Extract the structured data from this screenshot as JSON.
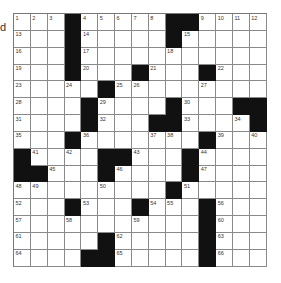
{
  "puzzle": {
    "edge_text": "d",
    "rows": 15,
    "cols": 15,
    "colors": {
      "block": "#111111",
      "cell": "#ffffff",
      "line": "#8a8a8a"
    },
    "grid": [
      [
        "1",
        "2",
        "3",
        "#",
        "4",
        "5",
        "6",
        "7",
        "8",
        "#",
        "#",
        "9",
        "10",
        "11",
        "12"
      ],
      [
        "13",
        "",
        "",
        "#",
        "14",
        "",
        "",
        "",
        "",
        "#",
        "15",
        "",
        "",
        "",
        ""
      ],
      [
        "16",
        "",
        "",
        "#",
        "17",
        "",
        "",
        "",
        "",
        "18",
        "",
        "",
        "",
        "",
        ""
      ],
      [
        "19",
        "",
        "",
        "#",
        "20",
        "",
        "",
        "#",
        "21",
        "",
        "",
        "#",
        "22",
        "",
        ""
      ],
      [
        "23",
        "",
        "",
        "24",
        "",
        "#",
        "25",
        "26",
        "",
        "",
        "",
        "27",
        "",
        "",
        ""
      ],
      [
        "28",
        "",
        "",
        "",
        "#",
        "29",
        "",
        "",
        "",
        "#",
        "30",
        "",
        "",
        "#",
        "#"
      ],
      [
        "31",
        "",
        "",
        "",
        "#",
        "32",
        "",
        "",
        "#",
        "#",
        "33",
        "",
        "",
        "34",
        "#"
      ],
      [
        "35",
        "",
        "",
        "#",
        "36",
        "",
        "",
        "",
        "37",
        "38",
        "",
        "#",
        "39",
        "",
        "40"
      ],
      [
        "#",
        "41",
        "",
        "42",
        "",
        "#",
        "#",
        "43",
        "",
        "",
        "#",
        "44",
        "",
        "",
        ""
      ],
      [
        "#",
        "#",
        "45",
        "",
        "",
        "#",
        "46",
        "",
        "",
        "",
        "#",
        "47",
        "",
        "",
        ""
      ],
      [
        "48",
        "49",
        "",
        "",
        "",
        "50",
        "",
        "",
        "",
        "#",
        "51",
        "",
        "",
        "",
        ""
      ],
      [
        "52",
        "",
        "",
        "#",
        "53",
        "",
        "",
        "#",
        "54",
        "55",
        "",
        "#",
        "56",
        "",
        ""
      ],
      [
        "57",
        "",
        "",
        "58",
        "",
        "",
        "",
        "59",
        "",
        "",
        "",
        "#",
        "60",
        "",
        ""
      ],
      [
        "61",
        "",
        "",
        "",
        "",
        "#",
        "62",
        "",
        "",
        "",
        "",
        "#",
        "63",
        "",
        ""
      ],
      [
        "64",
        "",
        "",
        "",
        "#",
        "#",
        "65",
        "",
        "",
        "",
        "",
        "#",
        "66",
        "",
        ""
      ]
    ]
  }
}
